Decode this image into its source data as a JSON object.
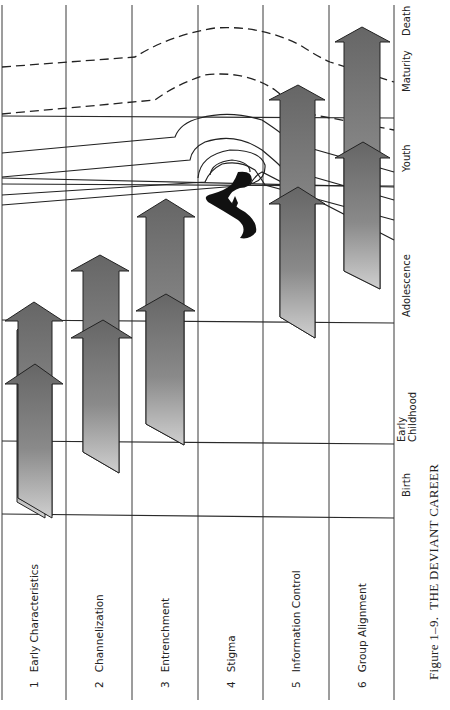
{
  "figure": {
    "caption_prefix": "Figure 1–9.",
    "caption_title": "THE DEVIANT CAREER"
  },
  "dimensions": [
    {
      "number": "1",
      "label": "Early Characteristics"
    },
    {
      "number": "2",
      "label": "Channelization"
    },
    {
      "number": "3",
      "label": "Entrenchment"
    },
    {
      "number": "4",
      "label": "Stigma"
    },
    {
      "number": "5",
      "label": "Information Control"
    },
    {
      "number": "6",
      "label": "Group Alignment"
    }
  ],
  "life_stages": [
    {
      "label": "Birth"
    },
    {
      "label_line1": "Early",
      "label_line2": "Childhood"
    },
    {
      "label": "Adolescence"
    },
    {
      "label": "Youth"
    },
    {
      "label": "Maturity"
    },
    {
      "label": "Death"
    }
  ],
  "colors": {
    "line": "#2a2a2a",
    "arrow_dark": "#6e6e6e",
    "arrow_light": "#c8c8c8",
    "stigma_mark": "#111111"
  }
}
